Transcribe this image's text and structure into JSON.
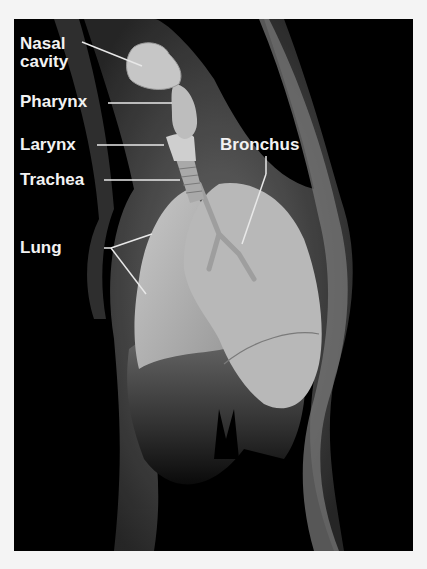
{
  "diagram": {
    "colors": {
      "background": "#000000",
      "label": "#f2f2f2",
      "leader": "#e8e8e8",
      "page": "#f4f4f4"
    },
    "labels": [
      {
        "id": "nasal-cavity",
        "line1": "Nasal",
        "line2": "cavity"
      },
      {
        "id": "pharynx",
        "text": "Pharynx"
      },
      {
        "id": "larynx",
        "text": "Larynx"
      },
      {
        "id": "trachea",
        "text": "Trachea"
      },
      {
        "id": "lung",
        "text": "Lung"
      },
      {
        "id": "bronchus",
        "text": "Bronchus"
      }
    ]
  }
}
